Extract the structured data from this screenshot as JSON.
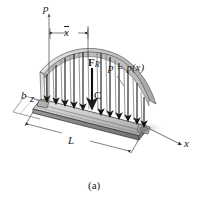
{
  "figure": {
    "caption": "(a)",
    "labels": {
      "pressure_axis": "p",
      "xbar_dimension": "x",
      "resultant_force": "F",
      "resultant_force_subscript": "R",
      "pressure_function": "p = p(x)",
      "centroid": "C",
      "width_axis": "b",
      "depth_axis": "z",
      "length_dimension": "L",
      "x_axis": "x"
    },
    "colors": {
      "line": "#1d1d1d",
      "plate_top": "#b9b9b9",
      "plate_front": "#8f8f8f",
      "plate_edge": "#5a5a5a",
      "surface_fill": "#d8d8d8",
      "surface_band": "#a8a8a8",
      "shadow": "#e8e8e8",
      "background": "#ffffff"
    },
    "geometry": {
      "arrow_count": 11,
      "load_curve": "decreasing-parabolic-arch",
      "projection": "oblique-axonometric"
    }
  }
}
